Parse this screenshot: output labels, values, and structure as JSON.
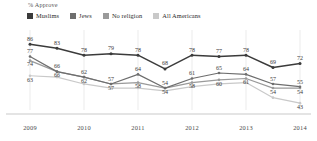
{
  "chart_data": {
    "type": "line",
    "title": "",
    "ylabel": "% Approve",
    "xlabel": "",
    "grid": "vertical-faint",
    "legend_position": "top-left",
    "ylim": [
      38,
      92
    ],
    "x": [
      "2009",
      "2009.5",
      "2010",
      "2010.5",
      "2011",
      "2011.5",
      "2012",
      "2012.5",
      "2013",
      "2013.5",
      "2014"
    ],
    "tick_labels": [
      "2009",
      "2010",
      "2011",
      "2012",
      "2013",
      "2014"
    ],
    "tick_positions": [
      0,
      2,
      4,
      6,
      8,
      10
    ],
    "series": [
      {
        "name": "Muslims",
        "color": "#3b3b3b",
        "values": [
          86,
          83,
          78,
          79,
          78,
          68,
          78,
          77,
          78,
          69,
          72
        ]
      },
      {
        "name": "Jews",
        "color": "#6e6e6e",
        "values": [
          77,
          66,
          62,
          57,
          64,
          54,
          61,
          65,
          64,
          57,
          55
        ]
      },
      {
        "name": "No religion",
        "color": "#9a9a9a",
        "values": [
          74,
          66,
          62,
          57,
          58,
          54,
          58,
          60,
          61,
          54,
          54
        ]
      },
      {
        "name": "All Americans",
        "color": "#c9c9c9",
        "values": [
          63,
          62,
          57,
          54,
          54,
          52,
          55,
          57,
          58,
          47,
          43
        ]
      }
    ],
    "visible_labels": {
      "Muslims": [
        86,
        83,
        78,
        79,
        78,
        68,
        78,
        77,
        78,
        69,
        72
      ],
      "Jews": [
        77,
        66,
        62,
        57,
        64,
        54,
        61,
        65,
        64,
        57,
        55
      ],
      "No religion": [
        74,
        66,
        62,
        57,
        58,
        54,
        58,
        60,
        61,
        54,
        54
      ],
      "All Americans": [
        63,
        null,
        null,
        null,
        null,
        null,
        null,
        null,
        null,
        null,
        43
      ]
    }
  },
  "legend": {
    "items": [
      {
        "label": "Muslims"
      },
      {
        "label": "Jews"
      },
      {
        "label": "No religion"
      },
      {
        "label": "All Americans"
      }
    ]
  },
  "header": {
    "y_axis_caption": "% Approve"
  }
}
